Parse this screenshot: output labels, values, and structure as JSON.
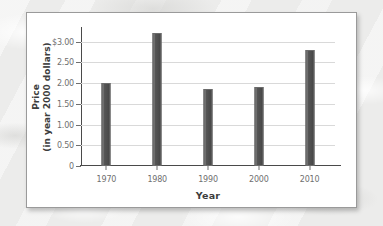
{
  "figure": {
    "panel_background": "#ffffff",
    "border_color": "#9a9a9a",
    "bar_color": "#555555",
    "gridline_color": "#d9d9d9",
    "axis_color": "#4a4a4a"
  },
  "chart_data": {
    "type": "bar",
    "title": "",
    "xlabel": "Year",
    "ylabel_line1": "Price",
    "ylabel_line2": "(in year 2000 dollars)",
    "categories": [
      "1970",
      "1980",
      "1990",
      "2000",
      "2010"
    ],
    "values": [
      2.0,
      3.2,
      1.85,
      1.9,
      2.8
    ],
    "ylim": [
      0,
      3.35
    ],
    "yticks": [
      0,
      0.5,
      1.0,
      1.5,
      2.0,
      2.5,
      3.0
    ],
    "ytick_labels": [
      "0",
      "0.50",
      "1.00",
      "1.50",
      "2.00",
      "2.50",
      "$3.00"
    ],
    "grid": true,
    "grid_axis": "y",
    "legend": false,
    "legend_position": "none"
  }
}
